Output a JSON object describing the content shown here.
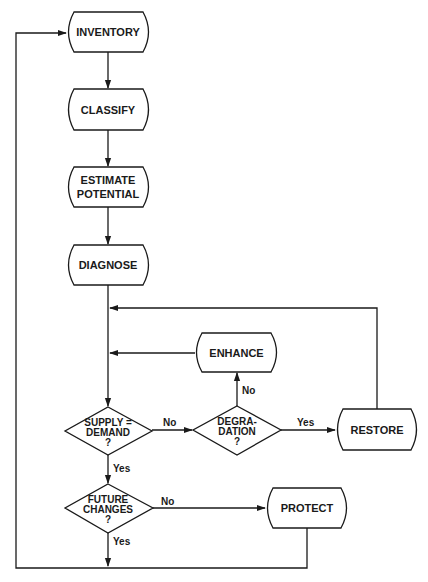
{
  "diagram": {
    "type": "flowchart",
    "colors": {
      "line": "#1a1a1a",
      "background": "#ffffff"
    },
    "nodes": {
      "inventory": {
        "label": "INVENTORY"
      },
      "classify": {
        "label": "CLASSIFY"
      },
      "estimate": {
        "line1": "ESTIMATE",
        "line2": "POTENTIAL"
      },
      "diagnose": {
        "label": "DIAGNOSE"
      },
      "enhance": {
        "label": "ENHANCE"
      },
      "restore": {
        "label": "RESTORE"
      },
      "protect": {
        "label": "PROTECT"
      }
    },
    "decisions": {
      "supply_demand": {
        "line1": "SUPPLY =",
        "line2": "DEMAND",
        "line3": "?"
      },
      "degradation": {
        "line1": "DEGRA-",
        "line2": "DATION",
        "line3": "?"
      },
      "future_changes": {
        "line1": "FUTURE",
        "line2": "CHANGES",
        "line3": "?"
      }
    },
    "edge_labels": {
      "supply_no": "No",
      "supply_yes": "Yes",
      "degradation_no": "No",
      "degradation_yes": "Yes",
      "future_no": "No",
      "future_yes": "Yes"
    }
  }
}
